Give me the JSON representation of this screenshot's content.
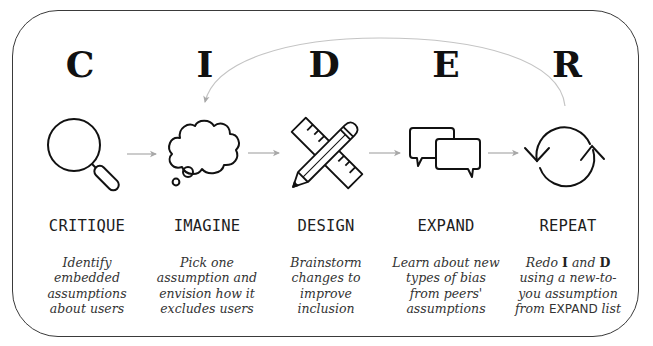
{
  "diagram": {
    "title_cut_off": "",
    "loop_arrow": {
      "from": "REPEAT",
      "to": "IMAGINE",
      "color": "#bdbdbd"
    },
    "flow_arrow_color": "#b0b0b0",
    "steps": [
      {
        "letter": "C",
        "icon": "magnifying-glass-icon",
        "label": "CRITIQUE",
        "description": [
          "Identify",
          "embedded",
          "assumptions",
          "about users"
        ]
      },
      {
        "letter": "I",
        "icon": "thought-cloud-icon",
        "label": "IMAGINE",
        "description": [
          "Pick one",
          "assumption and",
          "envision how it",
          "excludes users"
        ]
      },
      {
        "letter": "D",
        "icon": "pencil-ruler-icon",
        "label": "DESIGN",
        "description": [
          "Brainstorm",
          "changes to",
          "improve",
          "inclusion"
        ]
      },
      {
        "letter": "E",
        "icon": "speech-bubbles-icon",
        "label": "EXPAND",
        "description": [
          "Learn about new",
          "types of bias",
          "from peers'",
          "assumptions"
        ]
      },
      {
        "letter": "R",
        "icon": "refresh-cycle-icon",
        "label": "REPEAT",
        "description_parts": {
          "line1_a": "Redo ",
          "line1_b": "I",
          "line1_c": " and ",
          "line1_d": "D",
          "line2": "using a new-to-",
          "line3": "you assumption",
          "line4_a": "from ",
          "line4_b": "EXPAND",
          "line4_c": " list"
        }
      }
    ]
  }
}
